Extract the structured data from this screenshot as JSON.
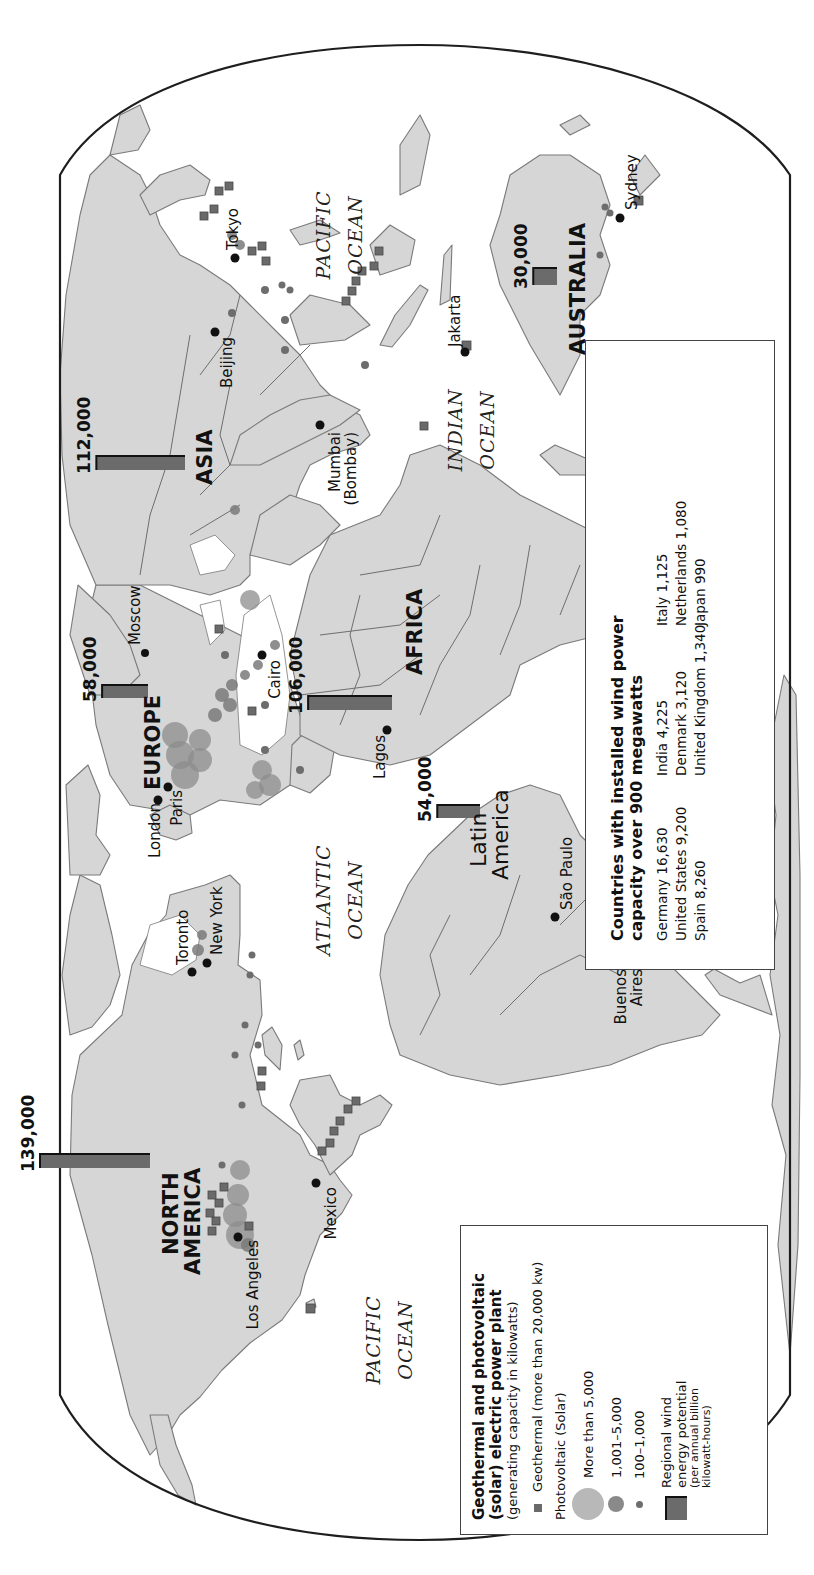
{
  "map": {
    "title": "World renewable energy: geothermal, photovoltaic and wind power",
    "orientation": "rotated 90° counter-clockwise",
    "colors": {
      "land": "#d6d6d6",
      "boundary": "#7a7a7a",
      "outline": "#1e1e1e",
      "wind_bar": "#6b6b6b",
      "geothermal": "#6a6a6a",
      "solar": "#8c8c8c",
      "city": "#111111"
    },
    "oceans": [
      {
        "id": "pacific-east",
        "line1": "PACIFIC",
        "line2": "OCEAN"
      },
      {
        "id": "atlantic",
        "line1": "ATLANTIC",
        "line2": "OCEAN"
      },
      {
        "id": "indian",
        "line1": "INDIAN",
        "line2": "OCEAN"
      },
      {
        "id": "pacific-west",
        "line1": "PACIFIC",
        "line2": "OCEAN"
      }
    ],
    "regions": [
      {
        "id": "north-america",
        "line1": "NORTH",
        "line2": "AMERICA",
        "wind_potential": "139,000",
        "wind_value": 139000
      },
      {
        "id": "latin-america",
        "line1": "Latin",
        "line2": "America",
        "wind_potential": "54,000",
        "wind_value": 54000
      },
      {
        "id": "europe",
        "line1": "EUROPE",
        "line2": "",
        "wind_potential": "58,000",
        "wind_value": 58000
      },
      {
        "id": "africa",
        "line1": "AFRICA",
        "line2": "",
        "wind_potential": "106,000",
        "wind_value": 106000
      },
      {
        "id": "asia",
        "line1": "ASIA",
        "line2": "",
        "wind_potential": "112,000",
        "wind_value": 112000
      },
      {
        "id": "australia",
        "line1": "AUSTRALIA",
        "line2": "",
        "wind_potential": "30,000",
        "wind_value": 30000
      }
    ],
    "cities": [
      {
        "name": "Los Angeles"
      },
      {
        "name": "Mexico"
      },
      {
        "name": "Toronto"
      },
      {
        "name": "New York"
      },
      {
        "name": "Buenos"
      },
      {
        "name": "Aires"
      },
      {
        "name": "São Paulo"
      },
      {
        "name": "London"
      },
      {
        "name": "Paris"
      },
      {
        "name": "Lagos"
      },
      {
        "name": "Cairo"
      },
      {
        "name": "Moscow"
      },
      {
        "name": "Mumbai"
      },
      {
        "name": "(Bombay)"
      },
      {
        "name": "Beijing"
      },
      {
        "name": "Tokyo"
      },
      {
        "name": "Jakarta"
      },
      {
        "name": "Sydney"
      }
    ]
  },
  "legend": {
    "title_line1": "Geothermal and photovoltaic",
    "title_line2": "(solar) electric power plant",
    "subtitle": "(generating capacity in kilowatts)",
    "geothermal_label": "Geothermal (more than 20,000 kw)",
    "photovoltaic_heading": "Photovoltaic (Solar)",
    "pv_items": [
      {
        "label": "More than 5,000",
        "symbol": "large-circle-icon"
      },
      {
        "label": "1,001–5,000",
        "symbol": "medium-circle-icon"
      },
      {
        "label": "100–1,000",
        "symbol": "small-circle-icon"
      }
    ],
    "wind_line1": "Regional wind",
    "wind_line2": "energy potential",
    "wind_line3": "(per annual billion",
    "wind_line4": "kilowatt-hours)"
  },
  "wind_capacity": {
    "title_line1": "Countries with installed wind power",
    "title_line2": "capacity over 900 megawatts",
    "countries": [
      {
        "label": "Germany 16,630",
        "country": "Germany",
        "megawatts": 16630
      },
      {
        "label": "India 4,225",
        "country": "India",
        "megawatts": 4225
      },
      {
        "label": "Italy 1,125",
        "country": "Italy",
        "megawatts": 1125
      },
      {
        "label": "United States 9,200",
        "country": "United States",
        "megawatts": 9200
      },
      {
        "label": "Denmark 3,120",
        "country": "Denmark",
        "megawatts": 3120
      },
      {
        "label": "Netherlands 1,080",
        "country": "Netherlands",
        "megawatts": 1080
      },
      {
        "label": "Spain 8,260",
        "country": "Spain",
        "megawatts": 8260
      },
      {
        "label": "United Kingdom 1,340",
        "country": "United Kingdom",
        "megawatts": 1340
      },
      {
        "label": "Japan 990",
        "country": "Japan",
        "megawatts": 990
      }
    ]
  }
}
